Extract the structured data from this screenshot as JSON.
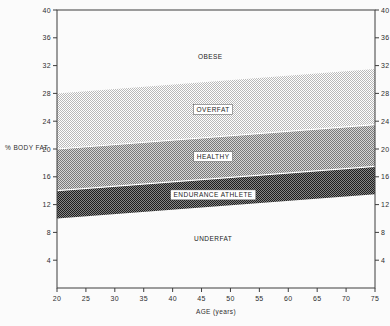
{
  "chart_data": {
    "type": "area",
    "title": "",
    "xlabel": "AGE (years)",
    "ylabel": "% BODY FAT",
    "xlim": [
      20,
      75
    ],
    "ylim": [
      0,
      40
    ],
    "x_ticks": [
      20,
      25,
      30,
      35,
      40,
      45,
      50,
      55,
      60,
      65,
      70,
      75
    ],
    "y_ticks": [
      4,
      8,
      12,
      16,
      20,
      24,
      28,
      32,
      36,
      40
    ],
    "x": [
      20,
      75
    ],
    "grid": false,
    "legend": null,
    "bands": [
      {
        "label": "OBESE",
        "upper": [
          40,
          40
        ],
        "lower": [
          28,
          31.5
        ],
        "fill": "white",
        "boxed_label": false,
        "label_pos": {
          "age": 46.5,
          "pct": 33.3
        }
      },
      {
        "label": "OVERFAT",
        "upper": [
          28,
          31.5
        ],
        "lower": [
          20,
          23.5
        ],
        "fill": "light-dither",
        "boxed_label": true,
        "label_pos": {
          "age": 47,
          "pct": 25.7
        }
      },
      {
        "label": "HEALTHY",
        "upper": [
          20,
          23.5
        ],
        "lower": [
          14,
          17.5
        ],
        "fill": "medium-dither",
        "boxed_label": true,
        "label_pos": {
          "age": 47,
          "pct": 18.9
        }
      },
      {
        "label": "ENDURANCE ATHLETE",
        "upper": [
          14,
          17.5
        ],
        "lower": [
          10,
          13.5
        ],
        "fill": "dark-dither",
        "boxed_label": true,
        "label_pos": {
          "age": 47,
          "pct": 13.4
        }
      },
      {
        "label": "UNDERFAT",
        "upper": [
          10,
          13.5
        ],
        "lower": [
          0,
          0
        ],
        "fill": "white",
        "boxed_label": false,
        "label_pos": {
          "age": 47,
          "pct": 7.1
        }
      }
    ],
    "colors": {
      "light_bg": "#ffffff",
      "light_fg": "#b9b9b9",
      "medium_bg": "#d6d6d6",
      "medium_fg": "#7a7a7a",
      "dark_bg": "#868686",
      "dark_fg": "#1e1e1e",
      "axis": "#3d3d3d",
      "text": "#2e2e2e",
      "separator": "#ffffff",
      "label_box_border": "#4a4a4a"
    }
  }
}
